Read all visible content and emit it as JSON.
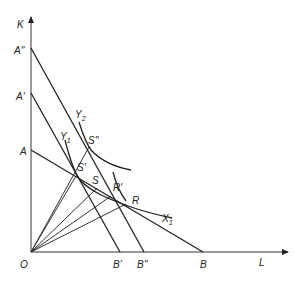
{
  "diagram": {
    "axes": {
      "y_label": "K",
      "x_label": "L",
      "origin_label": "O"
    },
    "isocost_lines": [
      {
        "id": "AB",
        "start_label": "A",
        "end_label": "B"
      },
      {
        "id": "A'B'",
        "start_label": "A'",
        "end_label": "B'"
      },
      {
        "id": "A''B''",
        "start_label": "A''",
        "end_label": "B''"
      }
    ],
    "isoquants": [
      {
        "id": "Y1X1",
        "label_start": "Y",
        "label_start_sub": "1",
        "label_end": "X",
        "label_end_sub": "1"
      },
      {
        "id": "Y2",
        "label": "Y",
        "label_sub": "2"
      }
    ],
    "points": {
      "S": "S",
      "S_prime": "S'",
      "S_double_prime": "S''",
      "R": "R",
      "R_prime": "R'"
    }
  }
}
